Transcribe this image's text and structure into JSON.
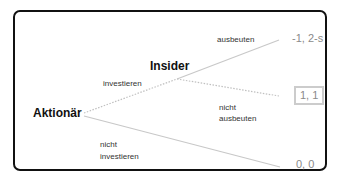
{
  "diagram": {
    "type": "game-tree",
    "nodes": {
      "root": {
        "label": "Aktionär"
      },
      "insider": {
        "label": "Insider"
      }
    },
    "edges": {
      "invest": {
        "label": "investieren",
        "style": "dotted"
      },
      "not_invest": {
        "label_line1": "nicht",
        "label_line2": "investieren",
        "style": "solid"
      },
      "exploit": {
        "label": "ausbeuten",
        "style": "solid"
      },
      "not_exploit": {
        "label_line1": "nicht",
        "label_line2": "ausbeuten",
        "style": "dotted"
      }
    },
    "payoffs": {
      "exploit": "-1, 2-s",
      "not_exploit": "1, 1",
      "not_invest": "0, 0"
    },
    "colors": {
      "frame": "#111111",
      "edge": "#c8c8c8",
      "payoff_text": "#8a8a8a",
      "highlight_box": "#cccccc"
    }
  }
}
